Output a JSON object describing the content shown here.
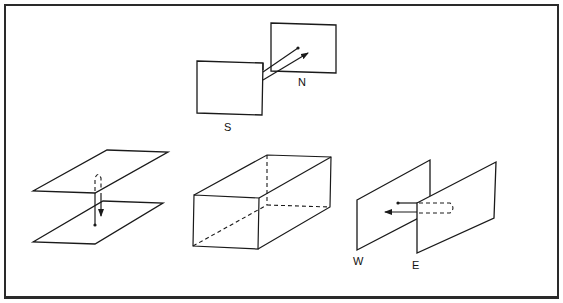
{
  "figure": {
    "panels": [
      {
        "id": "north-south",
        "labels": {
          "south": "S",
          "north": "N"
        },
        "arrow_direction": "south-to-north"
      },
      {
        "id": "vertical",
        "labels": {},
        "arrow_direction": "downward"
      },
      {
        "id": "box",
        "labels": {},
        "shape": "rectangular-prism"
      },
      {
        "id": "east-west",
        "labels": {
          "west": "W",
          "east": "E"
        },
        "arrow_direction": "east-to-west"
      }
    ]
  },
  "colors": {
    "ink": "#1a1a1a",
    "background": "#ffffff",
    "frame": "#2a2a2a"
  }
}
